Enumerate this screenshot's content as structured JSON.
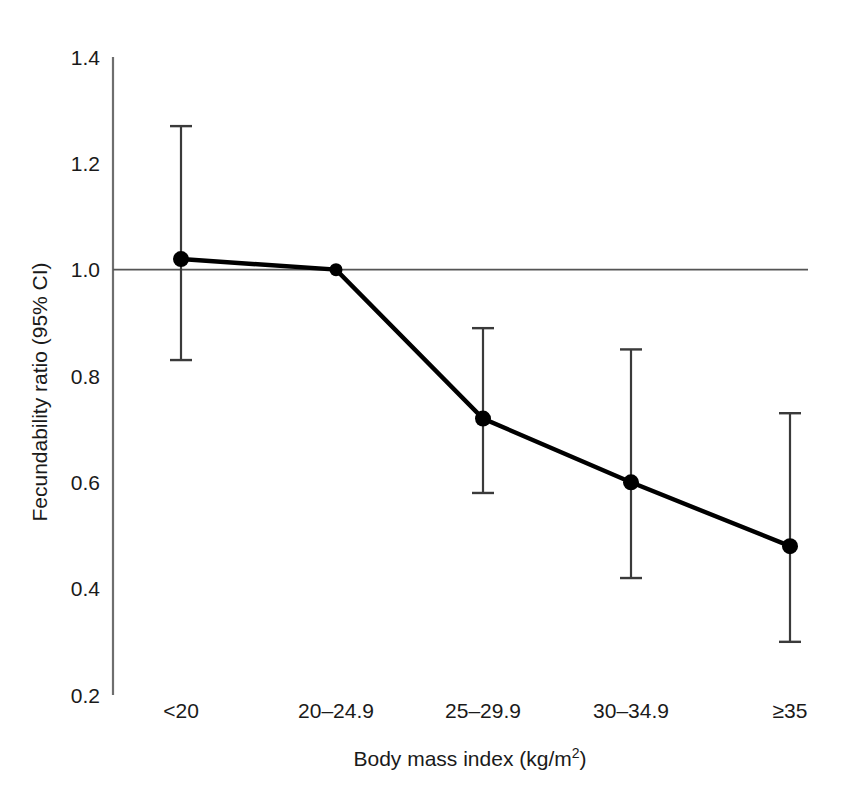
{
  "chart_data": {
    "type": "line",
    "title": "",
    "xlabel": "Body mass index (kg/m2)",
    "xlabel_main": "Body mass index (kg/m",
    "xlabel_sup": "2",
    "xlabel_tail": ")",
    "ylabel": "Fecundability ratio (95% CI)",
    "categories": [
      "<20",
      "20–24.9",
      "25–29.9",
      "30–34.9",
      "≥35"
    ],
    "values": [
      1.02,
      1.0,
      0.72,
      0.6,
      0.48
    ],
    "ci_low": [
      0.83,
      null,
      0.58,
      0.42,
      0.3
    ],
    "ci_high": [
      1.27,
      null,
      0.89,
      0.85,
      0.73
    ],
    "reference_category": "20–24.9",
    "reference_line": 1.0,
    "ylim": [
      0.2,
      1.4
    ],
    "yticks": [
      1.4,
      1.2,
      1.0,
      0.8,
      0.6,
      0.4,
      0.2
    ],
    "ytick_labels": [
      "1.4",
      "1.2",
      "1.0",
      "0.8",
      "0.6",
      "0.4",
      "0.2"
    ],
    "grid": false,
    "legend": "none",
    "marker": "filled-circle",
    "line_color": "#000000",
    "errorbar_color": "#3a3a3a",
    "axis_color": "#6e6e6e",
    "reference_line_color": "#555555",
    "background": "#ffffff"
  },
  "labels": {
    "y_axis_title": "Fecundability ratio (95% CI)",
    "x_axis_title_text": "Body mass index (kg/m",
    "x_axis_title_superscript": "2",
    "x_axis_title_close": ")"
  }
}
